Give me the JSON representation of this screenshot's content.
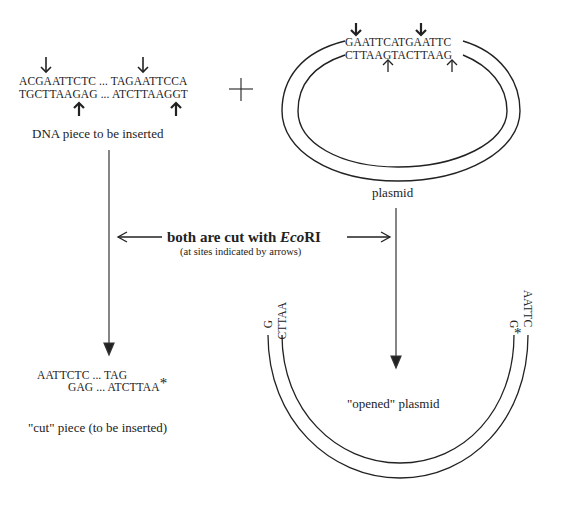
{
  "insert_dna": {
    "top_strand": "ACGAATTCTC ... TAGAATTCCA",
    "bottom_strand": "TGCTTAAGAG ... ATCTTAAGGT",
    "label": "DNA piece to be inserted"
  },
  "plus_sign": "+",
  "plasmid": {
    "top_strand": "GAATTCATGAATTC",
    "bottom_strand": "CTTAAGTACTTAAG",
    "label": "plasmid"
  },
  "cut_instruction": {
    "main_prefix": "both are cut with ",
    "enzyme_italic": "Eco",
    "enzyme_roman": "RI",
    "subtext": "(at sites indicated by arrows)"
  },
  "cut_piece": {
    "top_strand": "AATTCTC ... TAG",
    "bottom_strand": "GAG ... ATCTTAA",
    "asterisk": "*",
    "label": "\"cut\" piece (to be inserted)"
  },
  "opened_plasmid": {
    "left_outer_end": "G",
    "left_inner_end": "CTTAA",
    "right_outer_end": "AATTC",
    "right_inner_end": "G",
    "asterisk": "*",
    "label": "\"opened\" plasmid"
  },
  "colors": {
    "line": "#222222",
    "text": "#222222",
    "background": "#ffffff"
  }
}
